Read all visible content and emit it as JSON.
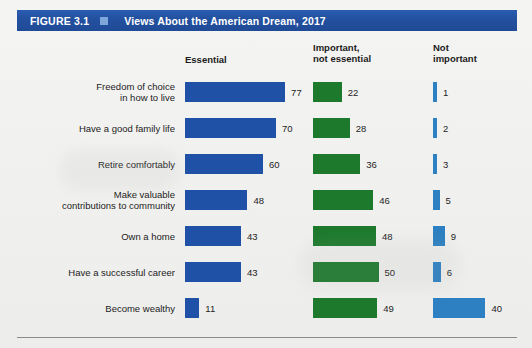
{
  "figure": {
    "number": "FIGURE 3.1",
    "marker": "square-marker",
    "title": "Views About the American Dream, 2017"
  },
  "columns": [
    {
      "key": "essential",
      "header": "Essential",
      "color": "#1f51a6"
    },
    {
      "key": "important",
      "header": "Important,\nnot essential",
      "color": "#1d7a2d"
    },
    {
      "key": "notimp",
      "header": "Not\nimportant",
      "color": "#2d80c1"
    }
  ],
  "chart_data": {
    "type": "bar",
    "title": "Views About the American Dream, 2017",
    "xlabel": "",
    "ylabel": "",
    "xlim": [
      0,
      100
    ],
    "grid": false,
    "orientation": "horizontal",
    "legend_position": "top",
    "categories": [
      "Freedom of choice\nin how to live",
      "Have a good family life",
      "Retire comfortably",
      "Make valuable\ncontributions to community",
      "Own a home",
      "Have a successful career",
      "Become wealthy"
    ],
    "series": [
      {
        "name": "Essential",
        "color": "#1f51a6",
        "values": [
          77,
          70,
          60,
          48,
          43,
          43,
          11
        ]
      },
      {
        "name": "Important, not essential",
        "color": "#1d7a2d",
        "values": [
          22,
          28,
          36,
          46,
          48,
          50,
          49
        ]
      },
      {
        "name": "Not important",
        "color": "#2d80c1",
        "values": [
          1,
          2,
          3,
          5,
          9,
          6,
          40
        ]
      }
    ]
  }
}
